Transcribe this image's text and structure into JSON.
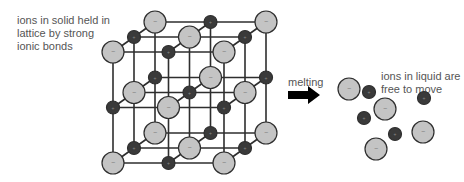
{
  "labels": {
    "solid": "ions in solid held in lattice by strong ionic bonds",
    "melting": "melting",
    "liquid": "ions in liquid are free to move"
  },
  "colors": {
    "anion_fill": "#c4c4c4",
    "cation_fill": "#3a3a3a",
    "outline": "#2e2e2e",
    "bond": "#2e2e2e",
    "text": "#555555",
    "arrow": "#000000"
  },
  "lattice": {
    "size": 3,
    "back_origin": [
      155,
      22
    ],
    "spacing": 55.5,
    "depth_step": [
      -21,
      15
    ],
    "anion_radius": 11,
    "cation_radius": 6.5,
    "anion_symbol": "−",
    "cation_symbol": "+"
  },
  "liquid_ions": [
    {
      "type": "anion",
      "x": 349,
      "y": 89
    },
    {
      "type": "cation",
      "x": 369,
      "y": 92
    },
    {
      "type": "anion",
      "x": 385,
      "y": 109
    },
    {
      "type": "cation",
      "x": 364,
      "y": 118
    },
    {
      "type": "cation",
      "x": 424,
      "y": 98
    },
    {
      "type": "cation",
      "x": 395,
      "y": 134
    },
    {
      "type": "anion",
      "x": 423,
      "y": 132
    },
    {
      "type": "anion",
      "x": 376,
      "y": 149
    }
  ],
  "arrow": {
    "x": 288,
    "y": 95,
    "length": 32
  }
}
